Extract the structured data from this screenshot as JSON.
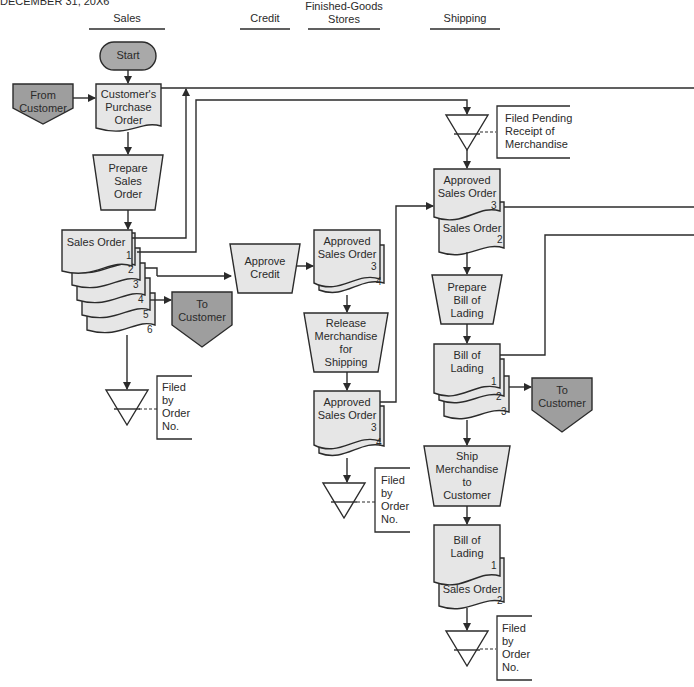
{
  "title": "DECEMBER 31, 20X6",
  "columns": [
    {
      "label": "Sales"
    },
    {
      "label": "Credit"
    },
    {
      "label": "Finished-Goods Stores",
      "line1": "Finished-Goods",
      "line2": "Stores"
    },
    {
      "label": "Shipping"
    }
  ],
  "colors": {
    "document_fill": "#e6e6e6",
    "offpage_fill": "#9e9e9e",
    "terminal_fill": "#a9a9a9",
    "line": "#2b2b2b"
  },
  "sales": {
    "start": "Start",
    "from_customer": [
      "From",
      "Customer"
    ],
    "customers_po": [
      "Customer's",
      "Purchase",
      "Order"
    ],
    "prepare_sales_order": [
      "Prepare",
      "Sales",
      "Order"
    ],
    "sales_order": "Sales Order",
    "sales_order_copies": [
      "1",
      "2",
      "3",
      "4",
      "5",
      "6"
    ],
    "to_customer": [
      "To",
      "Customer"
    ],
    "file_note": [
      "Filed",
      "by",
      "Order",
      "No."
    ]
  },
  "credit": {
    "approve_credit": [
      "Approve",
      "Credit"
    ]
  },
  "stores": {
    "approved_so_top": [
      "Approved",
      "Sales Order"
    ],
    "approved_so_top_copies": [
      "3",
      "4"
    ],
    "release": [
      "Release",
      "Merchandise",
      "for",
      "Shipping"
    ],
    "approved_so_bottom": [
      "Approved",
      "Sales Order"
    ],
    "approved_so_bottom_copies": [
      "3",
      "4"
    ],
    "file_note": [
      "Filed",
      "by",
      "Order",
      "No."
    ]
  },
  "shipping": {
    "pending_note": [
      "Filed Pending",
      "Receipt of",
      "Merchandise"
    ],
    "approved_so": [
      "Approved",
      "Sales Order"
    ],
    "approved_so_copy": "3",
    "sales_order": "Sales Order",
    "sales_order_copy": "2",
    "prepare_bol": [
      "Prepare",
      "Bill of",
      "Lading"
    ],
    "bol": [
      "Bill of",
      "Lading"
    ],
    "bol_copies": [
      "1",
      "2",
      "3"
    ],
    "to_customer": [
      "To",
      "Customer"
    ],
    "ship": [
      "Ship",
      "Merchandise",
      "to",
      "Customer"
    ],
    "final_bol": [
      "Bill of",
      "Lading"
    ],
    "final_bol_copy": "1",
    "final_so": "Sales Order",
    "final_so_copy": "2",
    "file_note": [
      "Filed",
      "by",
      "Order",
      "No."
    ]
  }
}
